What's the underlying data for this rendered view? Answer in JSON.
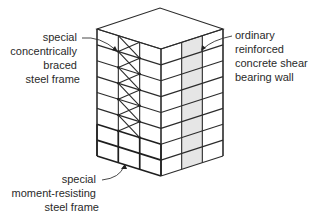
{
  "diagram": {
    "labels": {
      "braced_frame": [
        "special",
        "concentrically",
        "braced",
        "steel frame"
      ],
      "shear_wall": [
        "ordinary",
        "reinforced",
        "concrete shear",
        "bearing wall"
      ],
      "moment_frame": [
        "special",
        "moment-resisting",
        "steel frame"
      ]
    },
    "building": {
      "stories": 8,
      "bays_left_face": 3,
      "bays_right_face": 3,
      "braced_bay_index": 1,
      "braced_stories": 6,
      "shear_wall_bay_index": 1,
      "moment_frame_stories": 2
    },
    "colors": {
      "line": "#2b2b2b",
      "shear_wall_fill": "#e6e6e6",
      "text": "#2a2a2a"
    }
  }
}
